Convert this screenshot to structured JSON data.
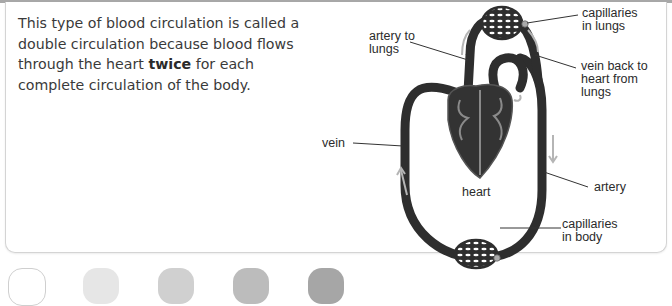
{
  "paragraph": {
    "before": "This type of blood circulation is called a double circulation because blood flows through the heart ",
    "bold": "twice",
    "after": " for each complete circulation of the body."
  },
  "diagram": {
    "title": "Double circulation",
    "labels": {
      "capillaries_lungs": "capillaries\nin lungs",
      "artery_to_lungs": "artery to\nlungs",
      "vein_back": "vein back to\nheart from\nlungs",
      "vein": "vein",
      "heart": "heart",
      "artery": "artery",
      "capillaries_body": "capillaries\nin body"
    },
    "colors": {
      "vessel": "#2e2e2e",
      "heart_fill": "#333333",
      "heart_lines": "#8a8a8a",
      "arrows": "#b5b5b5",
      "leader_lines": "#333333"
    }
  },
  "bottom_shapes": {
    "colors": [
      "#ffffff",
      "#e6e6e6",
      "#cfcfcf",
      "#b9b9b9",
      "#a3a3a3"
    ]
  }
}
